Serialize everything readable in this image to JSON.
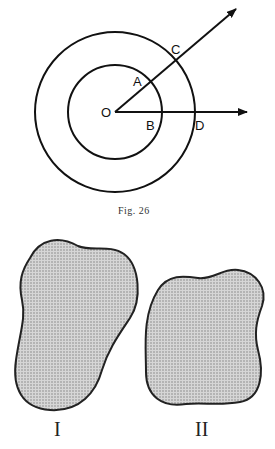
{
  "figure_top": {
    "caption": "Fig. 26",
    "points": {
      "O": "O",
      "A": "A",
      "B": "B",
      "C": "C",
      "D": "D"
    },
    "elements": [
      "inner circle centered at O",
      "outer circle centered at O",
      "ray from O through A and C",
      "ray from O through B and D"
    ]
  },
  "figure_bottom": {
    "labels": [
      "I",
      "II"
    ],
    "shapes": [
      "irregular stippled region I",
      "irregular stippled region II"
    ],
    "fill_color": "#b9b9b9",
    "outline_color": "#222222"
  }
}
